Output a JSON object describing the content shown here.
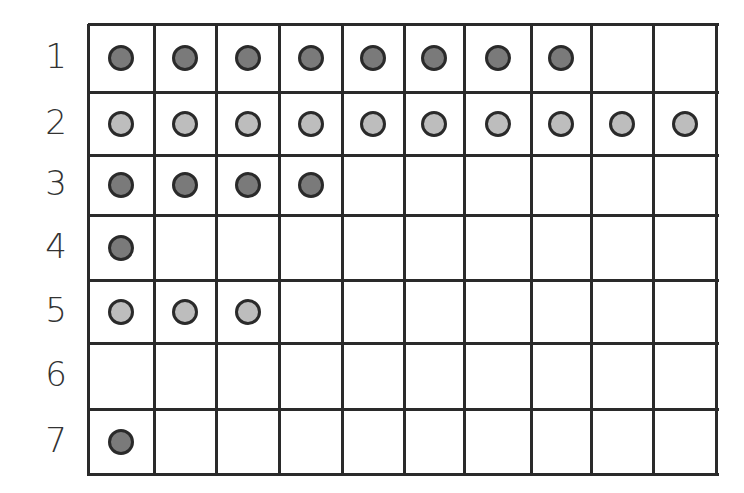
{
  "diagram": {
    "type": "dot-grid",
    "rows": 7,
    "columns": 10,
    "row_labels": [
      "1",
      "2",
      "3",
      "4",
      "5",
      "6",
      "7"
    ],
    "dot_counts": [
      8,
      10,
      4,
      1,
      3,
      0,
      1
    ],
    "dot_shades": [
      "dark",
      "light",
      "dark",
      "dark",
      "light",
      "none",
      "dark"
    ],
    "colors": {
      "dark": "#7a7a7a",
      "light": "#bdbdbd",
      "outline": "#2a2a2a",
      "grid": "#2a2a2a"
    }
  },
  "col_lines": [
    0,
    66,
    128,
    191,
    254,
    316,
    376,
    443,
    503,
    565,
    628
  ],
  "row_lines": [
    0,
    68,
    131,
    191,
    256,
    319,
    385,
    450
  ]
}
